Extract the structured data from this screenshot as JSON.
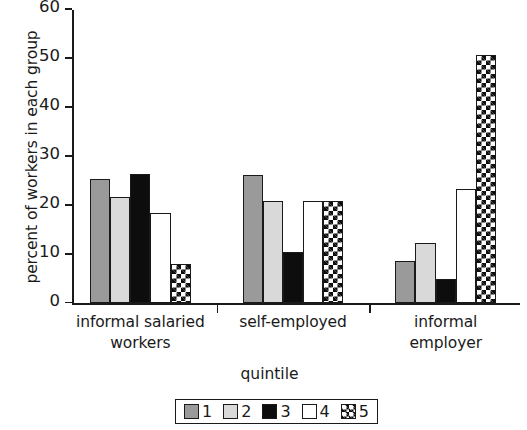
{
  "chart_data": {
    "type": "bar",
    "title": "",
    "xlabel": "quintile",
    "ylabel": "percent of workers in each group",
    "categories": [
      "informal salaried workers",
      "self-employed",
      "informal employer"
    ],
    "category_lines": [
      [
        "informal salaried",
        "workers"
      ],
      [
        "self-employed"
      ],
      [
        "informal",
        "employer"
      ]
    ],
    "series": [
      {
        "name": "1",
        "values": [
          25.5,
          26.2,
          8.6
        ],
        "fill": "medium-gray",
        "color": "#9a9a9a"
      },
      {
        "name": "2",
        "values": [
          21.7,
          21.0,
          12.3
        ],
        "fill": "light-gray",
        "color": "#d9d9d9"
      },
      {
        "name": "3",
        "values": [
          26.5,
          10.6,
          5.0
        ],
        "fill": "black",
        "color": "#0d0d0d"
      },
      {
        "name": "4",
        "values": [
          18.4,
          21.0,
          23.4
        ],
        "fill": "white",
        "color": "#ffffff"
      },
      {
        "name": "5",
        "values": [
          8.0,
          21.0,
          50.7
        ],
        "fill": "checkerboard",
        "color": "#ffffff"
      }
    ],
    "ylim": [
      0,
      60
    ],
    "yticks": [
      0,
      10,
      20,
      30,
      40,
      50,
      60
    ],
    "ytick_labels": [
      "0",
      "10",
      "20",
      "30",
      "40",
      "50",
      "60"
    ],
    "grid": false,
    "legend_position": "bottom",
    "legend_entries": [
      "1",
      "2",
      "3",
      "4",
      "5"
    ]
  }
}
